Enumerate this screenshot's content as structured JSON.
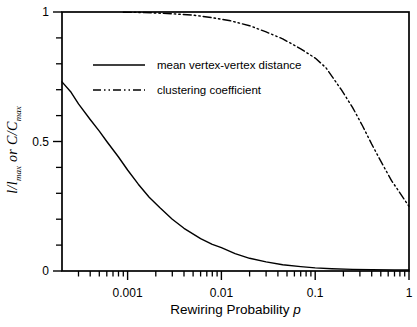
{
  "figure": {
    "background": "#ffffff",
    "ink_color": "#000000"
  },
  "chart_data": {
    "type": "line",
    "x_scale": "log",
    "y_scale": "linear",
    "xlim": [
      0.0002,
      1
    ],
    "ylim": [
      0,
      1
    ],
    "grid": "off",
    "frame": "full-box",
    "xlabel": "Rewiring Probability p",
    "xlabel_text": "Rewiring Probability ",
    "xlabel_var": "p",
    "ylabel": "l/lmax or C/Cmax",
    "ylabel_parts": {
      "a": "l/l",
      "a_sub": "max",
      "b": " or ",
      "c": "C/C",
      "c_sub": "max"
    },
    "legend": {
      "position": "upper-left-inside"
    },
    "x_axis": {
      "major_ticks": [
        {
          "value": 0.001,
          "label": "0.001"
        },
        {
          "value": 0.01,
          "label": "0.01"
        },
        {
          "value": 0.1,
          "label": "0.1"
        },
        {
          "value": 1,
          "label": "1"
        }
      ],
      "minor_ticks": [
        0.0003,
        0.0004,
        0.0005,
        0.0006,
        0.0007,
        0.0008,
        0.0009,
        0.002,
        0.003,
        0.004,
        0.005,
        0.006,
        0.007,
        0.008,
        0.009,
        0.02,
        0.03,
        0.04,
        0.05,
        0.06,
        0.07,
        0.08,
        0.09,
        0.2,
        0.3,
        0.4,
        0.5,
        0.6,
        0.7,
        0.8,
        0.9
      ]
    },
    "y_axis": {
      "major_ticks": [
        {
          "value": 0,
          "label": "0"
        },
        {
          "value": 0.5,
          "label": "0.5"
        },
        {
          "value": 1,
          "label": "1"
        }
      ],
      "minor_ticks": [
        0.1,
        0.2,
        0.3,
        0.4,
        0.6,
        0.7,
        0.8,
        0.9
      ]
    },
    "series": [
      {
        "name": "mean vertex-vertex distance",
        "style": "solid",
        "points": [
          [
            0.0002,
            0.73
          ],
          [
            0.00025,
            0.69
          ],
          [
            0.0003,
            0.645
          ],
          [
            0.0004,
            0.585
          ],
          [
            0.0005,
            0.54
          ],
          [
            0.0006,
            0.5
          ],
          [
            0.0008,
            0.44
          ],
          [
            0.001,
            0.39
          ],
          [
            0.0013,
            0.335
          ],
          [
            0.0017,
            0.285
          ],
          [
            0.0022,
            0.245
          ],
          [
            0.003,
            0.2
          ],
          [
            0.004,
            0.165
          ],
          [
            0.006,
            0.125
          ],
          [
            0.008,
            0.103
          ],
          [
            0.01,
            0.09
          ],
          [
            0.014,
            0.067
          ],
          [
            0.02,
            0.049
          ],
          [
            0.03,
            0.035
          ],
          [
            0.045,
            0.024
          ],
          [
            0.07,
            0.017
          ],
          [
            0.1,
            0.012
          ],
          [
            0.15,
            0.009
          ],
          [
            0.25,
            0.006
          ],
          [
            0.4,
            0.005
          ],
          [
            0.7,
            0.004
          ],
          [
            1,
            0.004
          ]
        ]
      },
      {
        "name": "clustering coefficient",
        "style": "dash-dot-dot",
        "points": [
          [
            0.0009,
            0.999
          ],
          [
            0.0015,
            0.998
          ],
          [
            0.002,
            0.996
          ],
          [
            0.003,
            0.993
          ],
          [
            0.005,
            0.988
          ],
          [
            0.008,
            0.978
          ],
          [
            0.0125,
            0.966
          ],
          [
            0.02,
            0.947
          ],
          [
            0.03,
            0.923
          ],
          [
            0.045,
            0.896
          ],
          [
            0.07,
            0.858
          ],
          [
            0.1,
            0.822
          ],
          [
            0.13,
            0.785
          ],
          [
            0.19,
            0.7
          ],
          [
            0.25,
            0.632
          ],
          [
            0.32,
            0.56
          ],
          [
            0.4,
            0.49
          ],
          [
            0.5,
            0.424
          ],
          [
            0.65,
            0.35
          ],
          [
            0.84,
            0.29
          ],
          [
            1,
            0.25
          ]
        ]
      }
    ]
  }
}
